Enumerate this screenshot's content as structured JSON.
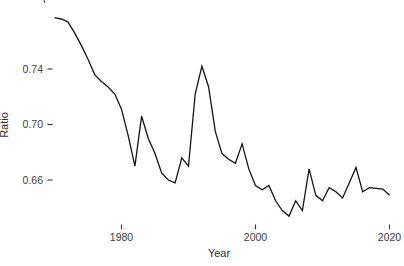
{
  "chart_data": {
    "type": "line",
    "title": "",
    "xlabel": "Year",
    "ylabel": "Ratio",
    "x": [
      1970,
      1971,
      1972,
      1973,
      1974,
      1975,
      1976,
      1977,
      1978,
      1979,
      1980,
      1981,
      1982,
      1983,
      1984,
      1985,
      1986,
      1987,
      1988,
      1989,
      1990,
      1991,
      1992,
      1993,
      1994,
      1995,
      1996,
      1997,
      1998,
      1999,
      2000,
      2001,
      2002,
      2003,
      2004,
      2005,
      2006,
      2007,
      2008,
      2009,
      2010,
      2011,
      2012,
      2013,
      2014,
      2015,
      2016,
      2017,
      2018,
      2019,
      2020
    ],
    "values": [
      0.777,
      0.776,
      0.774,
      0.766,
      0.757,
      0.747,
      0.736,
      0.731,
      0.727,
      0.722,
      0.711,
      0.692,
      0.67,
      0.706,
      0.69,
      0.679,
      0.665,
      0.66,
      0.658,
      0.676,
      0.67,
      0.722,
      0.742,
      0.727,
      0.695,
      0.679,
      0.675,
      0.672,
      0.686,
      0.668,
      0.656,
      0.653,
      0.656,
      0.645,
      0.638,
      0.634,
      0.645,
      0.638,
      0.668,
      0.649,
      0.645,
      0.6545,
      0.6515,
      0.647,
      0.658,
      0.669,
      0.6515,
      0.6545,
      0.654,
      0.6535,
      0.649
    ],
    "x_ticks": [
      1980,
      2000,
      2020
    ],
    "y_ticks": [
      0.74,
      0.7,
      0.66
    ],
    "xlim": [
      1969.5,
      2021.5
    ],
    "ylim": [
      0.63,
      0.79
    ],
    "grid": false,
    "legend": "none",
    "axis_lines": false,
    "line_color": "#141414",
    "tick_label_color": "#404040",
    "background_color": "#ffffff"
  }
}
